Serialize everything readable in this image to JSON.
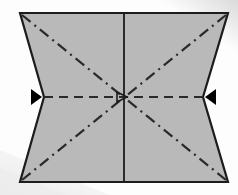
{
  "canvas": {
    "width": 238,
    "height": 195,
    "background_color": "#fdfdfd",
    "title": "Origami fold diagram - concave quadrilateral with fold creases"
  },
  "background": {
    "shadow_band_color": "#ececec",
    "shadow_band_color_light": "#f3f3f3",
    "corner_glow_color": "#d9d9d9"
  },
  "shape": {
    "name": "paper-panel",
    "fill_color": "#b9b9b9",
    "stroke_color": "#1c1c1c",
    "stroke_width": 2.2,
    "description": "Rectangle with concave V notches cut into the left and right edges at mid height",
    "points": [
      {
        "label": "top-left",
        "x": 20,
        "y": 13
      },
      {
        "label": "top-right",
        "x": 228,
        "y": 13
      },
      {
        "label": "right-notch-vertex",
        "x": 203,
        "y": 97
      },
      {
        "label": "bottom-right",
        "x": 228,
        "y": 182
      },
      {
        "label": "bottom-left",
        "x": 20,
        "y": 182
      },
      {
        "label": "left-notch-vertex",
        "x": 44,
        "y": 97
      }
    ]
  },
  "creases": {
    "center_vertical": {
      "name": "center-vertical-crease",
      "style": "solid",
      "color": "#1c1c1c",
      "width": 1.8,
      "x": 124,
      "y1": 13,
      "y2": 182
    },
    "horizontal_valley": {
      "name": "horizontal-valley-crease",
      "style": "dashed",
      "color": "#2a2a2a",
      "width": 2.2,
      "dash_pattern": "9 6",
      "x1": 44,
      "x2": 203,
      "y": 97
    },
    "diagonals": [
      {
        "name": "diagonal-crease-top-left",
        "style": "dash-dot",
        "color": "#2a2a2a",
        "width": 2.2,
        "dash_pattern": "11 5 2 5",
        "x1": 22,
        "y1": 15,
        "x2": 122,
        "y2": 96
      },
      {
        "name": "diagonal-crease-top-right",
        "style": "dash-dot",
        "color": "#2a2a2a",
        "width": 2.2,
        "dash_pattern": "11 5 2 5",
        "x1": 226,
        "y1": 15,
        "x2": 126,
        "y2": 96
      },
      {
        "name": "diagonal-crease-bottom-left",
        "style": "dash-dot",
        "color": "#2a2a2a",
        "width": 2.2,
        "dash_pattern": "11 5 2 5",
        "x1": 22,
        "y1": 180,
        "x2": 122,
        "y2": 99
      },
      {
        "name": "diagonal-crease-bottom-right",
        "style": "dash-dot",
        "color": "#2a2a2a",
        "width": 2.2,
        "dash_pattern": "11 5 2 5",
        "x1": 226,
        "y1": 180,
        "x2": 126,
        "y2": 99
      }
    ]
  },
  "arrows": {
    "color": "#000000",
    "items": [
      {
        "name": "left-push-arrow",
        "direction": "right",
        "points": "31,89 42,97 31,105",
        "description": "Solid triangular push arrow at left notch pointing inward"
      },
      {
        "name": "right-push-arrow",
        "direction": "left",
        "points": "216,89 205,97 216,105",
        "description": "Solid triangular push arrow at right notch pointing inward"
      },
      {
        "name": "center-arrowhead",
        "direction": "right",
        "points": "117,92 127,97 117,102",
        "description": "Small open arrowhead at the center crossing point"
      }
    ]
  }
}
